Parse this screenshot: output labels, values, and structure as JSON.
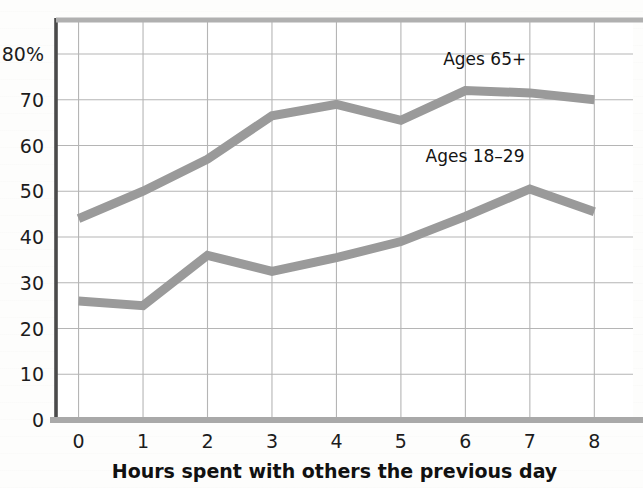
{
  "chart_data": {
    "type": "line",
    "title": "",
    "subtitle": "",
    "xlabel": "Hours spent with others the previous day",
    "ylabel": "",
    "x": [
      0,
      1,
      2,
      3,
      4,
      5,
      6,
      7,
      8
    ],
    "xtick_labels": [
      "0",
      "1",
      "2",
      "3",
      "4",
      "5",
      "6",
      "7",
      "8"
    ],
    "ytick_labels": [
      "0",
      "10",
      "20",
      "30",
      "40",
      "50",
      "60",
      "70",
      "80%"
    ],
    "ytick_values": [
      0,
      10,
      20,
      30,
      40,
      50,
      60,
      70,
      80
    ],
    "xlim": [
      -0.35,
      8.6
    ],
    "ylim": [
      0,
      85
    ],
    "grid": true,
    "legend_position": "inline-annotations",
    "series": [
      {
        "name": "Ages 65+",
        "color": "#9a9a9a",
        "values": [
          44,
          50,
          57,
          66.5,
          69,
          65.5,
          72,
          71.5,
          70
        ],
        "label_x": 6.3,
        "label_y": 77.5
      },
      {
        "name": "Ages 18–29",
        "color": "#9a9a9a",
        "values": [
          26,
          25,
          36,
          32.5,
          35.5,
          39,
          44.5,
          50.5,
          45.5
        ],
        "label_x": 6.15,
        "label_y": 56.5
      }
    ],
    "annotations": [
      {
        "text": "Ages 65+",
        "x": 6.3,
        "y": 77.5
      },
      {
        "text": "Ages 18–29",
        "x": 6.15,
        "y": 56.5
      }
    ],
    "style": {
      "line_color": "#9a9a9a",
      "line_width_px": 9,
      "grid_color": "#b5b5b5",
      "axis_color": "#5c5c5c",
      "background": "#fdfdfc",
      "plot_background": "#ffffff"
    }
  },
  "axes": {
    "x_axis_title": "Hours spent with others the previous day",
    "y_axis_unit_suffix": "%"
  }
}
